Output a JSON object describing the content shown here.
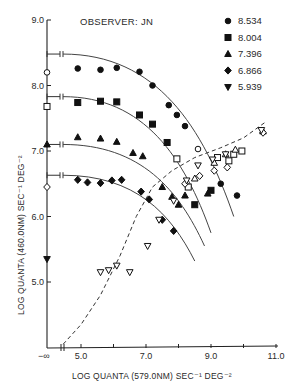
{
  "chart_data": {
    "type": "scatter",
    "title": "OBSERVER: JN",
    "xlabel": "LOG QUANTA (579.0NM) SEC⁻¹ DEG⁻²",
    "ylabel": "LOG QUANTA (460.0NM) SEC⁻¹ DEG⁻²",
    "xlim": [
      4.0,
      11.0
    ],
    "ylim": [
      4.0,
      9.0
    ],
    "x_ticks": [
      5.0,
      6.0,
      7.0,
      8.0,
      9.0,
      10.0,
      11.0
    ],
    "x_tick_labels": [
      "5.0",
      "7.0",
      "9.0",
      "11.0"
    ],
    "x_tick_label_values": [
      5.0,
      7.0,
      9.0,
      11.0
    ],
    "y_ticks": [
      5.0,
      6.0,
      7.0,
      8.0,
      9.0
    ],
    "y_tick_labels": [
      "5.0",
      "6.0",
      "7.0",
      "8.0",
      "9.0"
    ],
    "x_origin_label": "−∞",
    "legend_position": "top-right",
    "grid": false,
    "series": [
      {
        "name": "8.534",
        "marker": "circle",
        "axis_value": 8.2,
        "points": [
          [
            4.9,
            8.26
          ],
          [
            5.6,
            8.24
          ],
          [
            6.1,
            8.27
          ],
          [
            6.8,
            8.21
          ],
          [
            7.2,
            8.0
          ],
          [
            7.7,
            7.7
          ],
          [
            7.95,
            7.55
          ],
          [
            8.2,
            7.38
          ],
          [
            8.6,
            7.03
          ],
          [
            9.3,
            6.5
          ],
          [
            9.8,
            6.32
          ]
        ]
      },
      {
        "name": "8.004",
        "marker": "square",
        "axis_value": 7.68,
        "points": [
          [
            4.9,
            7.74
          ],
          [
            5.6,
            7.76
          ],
          [
            6.1,
            7.75
          ],
          [
            6.8,
            7.55
          ],
          [
            7.2,
            7.41
          ],
          [
            7.65,
            7.13
          ],
          [
            7.95,
            6.88
          ],
          [
            8.3,
            6.45
          ],
          [
            8.5,
            6.18
          ],
          [
            9.0,
            6.4
          ],
          [
            9.2,
            6.9
          ],
          [
            9.55,
            6.85
          ],
          [
            9.7,
            6.95
          ],
          [
            9.95,
            7.0
          ]
        ]
      },
      {
        "name": "7.396",
        "marker": "triangle-up",
        "axis_value": 7.1,
        "points": [
          [
            4.9,
            7.21
          ],
          [
            5.6,
            7.19
          ],
          [
            6.1,
            7.14
          ],
          [
            6.6,
            6.97
          ],
          [
            6.9,
            6.92
          ],
          [
            7.5,
            6.45
          ],
          [
            7.8,
            6.3
          ],
          [
            8.0,
            6.18
          ],
          [
            8.2,
            6.32
          ],
          [
            8.5,
            6.58
          ],
          [
            8.9,
            6.35
          ],
          [
            9.1,
            6.82
          ],
          [
            9.45,
            6.95
          ],
          [
            9.75,
            7.02
          ],
          [
            10.6,
            7.3
          ]
        ]
      },
      {
        "name": "6.866",
        "marker": "diamond",
        "axis_value": 6.45,
        "points": [
          [
            4.9,
            6.56
          ],
          [
            5.2,
            6.52
          ],
          [
            5.6,
            6.51
          ],
          [
            5.95,
            6.55
          ],
          [
            6.25,
            6.56
          ],
          [
            6.85,
            6.38
          ],
          [
            7.1,
            6.26
          ],
          [
            7.5,
            5.95
          ],
          [
            7.85,
            5.78
          ],
          [
            8.2,
            6.5
          ],
          [
            8.65,
            6.62
          ],
          [
            9.1,
            6.7
          ],
          [
            9.5,
            6.75
          ],
          [
            10.6,
            7.28
          ]
        ]
      },
      {
        "name": "5.939",
        "marker": "triangle-down",
        "axis_value": 5.35,
        "points": [
          [
            5.6,
            5.15
          ],
          [
            5.85,
            5.18
          ],
          [
            6.1,
            5.25
          ],
          [
            6.5,
            5.15
          ],
          [
            7.05,
            5.55
          ],
          [
            7.4,
            5.95
          ],
          [
            7.85,
            6.24
          ],
          [
            8.25,
            6.55
          ],
          [
            8.6,
            6.78
          ],
          [
            9.05,
            6.87
          ],
          [
            9.45,
            6.95
          ],
          [
            10.55,
            7.32
          ]
        ]
      }
    ],
    "fitted_curves": [
      {
        "name": "8.534",
        "plateau": 8.48,
        "end": [
          9.7,
          6.0
        ]
      },
      {
        "name": "8.004",
        "plateau": 7.83,
        "end": [
          9.0,
          5.75
        ]
      },
      {
        "name": "7.396",
        "plateau": 7.1,
        "end": [
          8.8,
          5.55
        ]
      },
      {
        "name": "6.866",
        "plateau": 6.63,
        "end": [
          8.5,
          5.32
        ]
      }
    ],
    "dashed_curve": {
      "description": "threshold curve",
      "points": [
        [
          4.45,
          4.05
        ],
        [
          5.0,
          4.35
        ],
        [
          5.6,
          4.8
        ],
        [
          6.2,
          5.4
        ],
        [
          6.7,
          6.0
        ],
        [
          7.2,
          6.45
        ],
        [
          7.8,
          6.7
        ],
        [
          8.5,
          6.9
        ],
        [
          9.3,
          7.05
        ],
        [
          10.0,
          7.2
        ],
        [
          10.7,
          7.45
        ]
      ]
    }
  }
}
